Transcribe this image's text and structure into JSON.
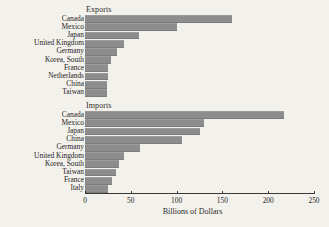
{
  "chart_data": {
    "type": "bar",
    "orientation": "horizontal",
    "title": "",
    "xlabel": "Billions of Dollars",
    "ylabel": "",
    "xlim": [
      0,
      250
    ],
    "xticks": [
      0,
      50,
      100,
      150,
      200,
      250
    ],
    "grid": false,
    "legend": null,
    "bar_color": "#8d8d8d",
    "background_color": "#f3f1ec",
    "panels": [
      {
        "title": "Exports",
        "categories": [
          "Canada",
          "Mexico",
          "Japan",
          "United Kingdom",
          "Germany",
          "Korea, South",
          "France",
          "Netherlands",
          "China",
          "Taiwan"
        ],
        "values": [
          160,
          100,
          59,
          43,
          35,
          28,
          25,
          25,
          24,
          24
        ]
      },
      {
        "title": "Imports",
        "categories": [
          "Canada",
          "Mexico",
          "Japan",
          "China",
          "Germany",
          "United Kingdom",
          "Korea, South",
          "Taiwan",
          "France",
          "Italy"
        ],
        "values": [
          217,
          130,
          126,
          106,
          60,
          43,
          37,
          34,
          30,
          25
        ]
      }
    ]
  }
}
